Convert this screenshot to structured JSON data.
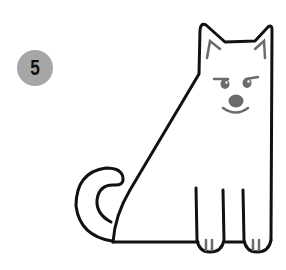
{
  "step": {
    "number": "5"
  },
  "colors": {
    "badge": "#a6a6a6",
    "outline": "#111111",
    "detail": "#6b6b6b",
    "background": "#ffffff"
  },
  "illustration": {
    "subject": "sitting dog outline drawing"
  }
}
